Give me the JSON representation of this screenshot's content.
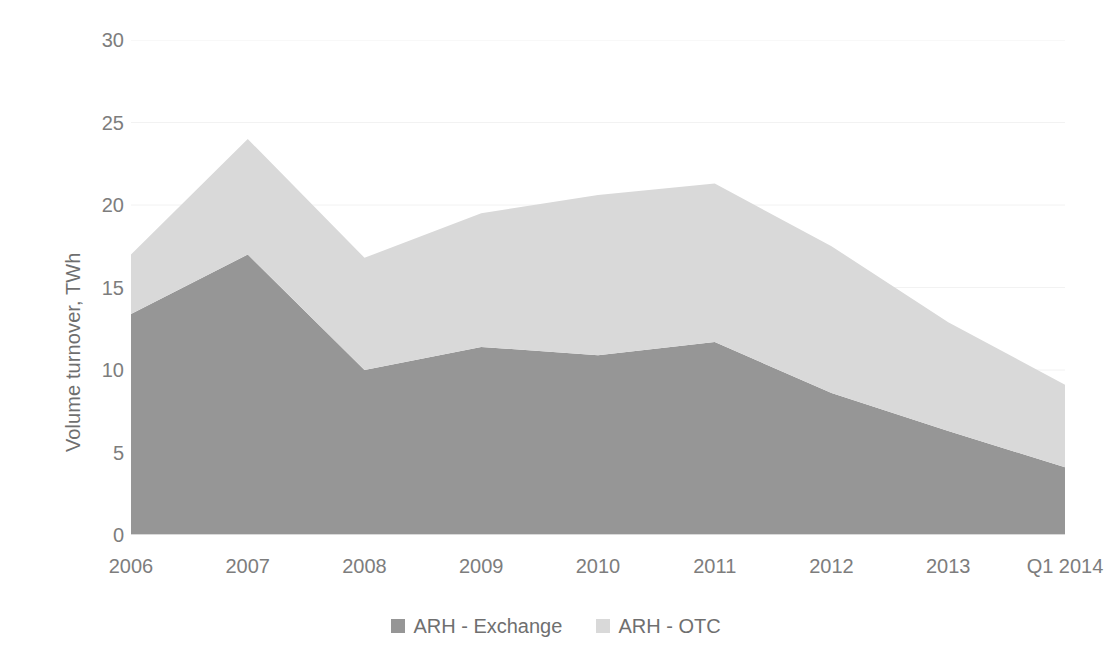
{
  "chart_data": {
    "type": "area",
    "stacked": true,
    "title": "",
    "xlabel": "",
    "ylabel": "Volume turnover, TWh",
    "categories": [
      "2006",
      "2007",
      "2008",
      "2009",
      "2010",
      "2011",
      "2012",
      "2013",
      "Q1 2014"
    ],
    "ylim": [
      0,
      30
    ],
    "yticks": [
      0,
      5,
      10,
      15,
      20,
      25,
      30
    ],
    "grid": true,
    "legend_position": "bottom",
    "series": [
      {
        "name": "ARH - Exchange",
        "color": "#969696",
        "values": [
          13.4,
          17.0,
          10.0,
          11.4,
          10.9,
          11.7,
          8.6,
          6.3,
          4.1
        ]
      },
      {
        "name": "ARH - OTC",
        "color": "#d9d9d9",
        "values": [
          3.6,
          7.0,
          6.8,
          8.1,
          9.7,
          9.6,
          8.9,
          6.6,
          5.0
        ]
      }
    ],
    "stacked_totals": [
      17.0,
      24.0,
      16.8,
      19.5,
      20.6,
      21.3,
      17.5,
      12.9,
      9.1
    ]
  },
  "axis": {
    "y_label": "Volume turnover, TWh",
    "y_tick_labels": [
      "30",
      "25",
      "20",
      "15",
      "10",
      "5",
      "0"
    ],
    "x_tick_labels": [
      "2006",
      "2007",
      "2008",
      "2009",
      "2010",
      "2011",
      "2012",
      "2013",
      "Q1 2014"
    ]
  },
  "legend": {
    "items": [
      {
        "label": "ARH - Exchange",
        "color": "#969696"
      },
      {
        "label": "ARH - OTC",
        "color": "#d9d9d9"
      }
    ]
  },
  "colors": {
    "exchange": "#969696",
    "otc": "#d9d9d9",
    "text": "#7d7d7d",
    "grid": "#f2f2f2",
    "background": "#ffffff"
  }
}
